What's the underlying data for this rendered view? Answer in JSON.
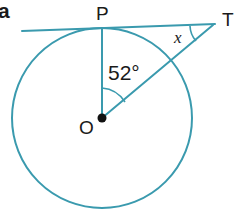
{
  "figure": {
    "part_label": "a",
    "colors": {
      "stroke": "#3a9aae",
      "text": "#1a1a1a",
      "background": "#ffffff",
      "center_dot": "#111111"
    },
    "points": {
      "center": {
        "label": "O",
        "x": 102,
        "y": 118
      },
      "tangent_point": {
        "label": "P",
        "x": 102,
        "y": 28
      },
      "external_point": {
        "label": "T",
        "x": 212,
        "y": 24
      }
    },
    "circle": {
      "cx": 102,
      "cy": 118,
      "r": 90
    },
    "tangent_line": {
      "x1": 22,
      "y1": 31,
      "x2": 214,
      "y2": 24
    },
    "radius_segment": {
      "x1": 102,
      "y1": 118,
      "x2": 102,
      "y2": 28
    },
    "oblique_segment": {
      "x1": 102,
      "y1": 118,
      "x2": 212,
      "y2": 25
    },
    "angles": [
      {
        "name": "central-angle",
        "vertex": "O",
        "label": "52°",
        "value": 52,
        "unit": "degrees"
      },
      {
        "name": "apex-angle",
        "vertex": "T",
        "label": "x",
        "value": null,
        "unit": "degrees"
      }
    ]
  }
}
